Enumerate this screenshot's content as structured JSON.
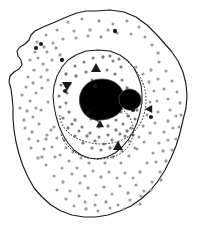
{
  "figure": {
    "name": "cell-diagram",
    "caption": "",
    "background_color": "#ffffff",
    "width": 207,
    "height": 235
  },
  "palette": {
    "outline": "#1a1a1a",
    "envelope": "#1a1a1a",
    "chromatin": "#262626",
    "organelle_fill": "#8a8a8a",
    "organelle_stroke": "#4d4d4d",
    "granule_light": "#9a9a9a",
    "granule_mid": "#7a7a7a",
    "granule_dark": "#1a1a1a",
    "background": "#ffffff"
  },
  "structures": {
    "plasma_membrane": {
      "label": "plasma-membrane",
      "path": "M 96 11 L 110 10 L 124 12 L 136 17 L 147 25 L 157 35 L 165 44 L 172 52 L 178 61 L 183 72 L 186 84 L 187 96 L 186 108 L 183 120 L 180 133 L 176 146 L 171 158 L 165 170 L 158 181 L 150 191 L 141 199 L 131 206 L 120 211 L 108 215 L 96 217 L 84 217 L 72 215 L 61 211 L 51 205 L 42 197 L 34 188 L 28 177 L 23 166 L 19 154 L 16 142 L 14 130 L 13 118 L 13 107 L 12 97 L 11 89 L 9 82 L 10 76 L 14 72 L 19 69 L 22 65 L 21 60 L 18 56 L 17 51 L 20 47 L 25 44 L 29 40 L 31 35 L 35 31 L 41 28 L 48 25 L 55 22 L 62 19 L 69 16 L 77 13 L 86 11 Z"
    },
    "nuclear_envelope": {
      "label": "nuclear-envelope",
      "path": "M 98 50 L 110 51 L 120 55 L 128 61 L 134 68 L 138 76 L 141 85 L 142 94 L 142 103 L 140 113 L 137 123 L 133 132 L 128 140 L 122 147 L 115 153 L 107 157 L 98 159 L 89 158 L 81 155 L 74 150 L 68 143 L 63 135 L 59 126 L 56 116 L 54 106 L 53 96 L 54 86 L 57 76 L 62 67 L 68 60 L 76 55 L 86 51 Z"
    },
    "chromatin_loop": {
      "label": "chromatin-loop",
      "path": "M 128 62 C 137 70, 143 80, 145 90 C 147 101, 146 111, 142 120 C 138 129, 131 136, 122 140 C 112 144, 101 145, 91 143 C 81 141, 72 137, 66 130 C 61 124, 59 118, 60 113"
    },
    "chromatin_loop_lower": {
      "label": "chromatin-loop-lower",
      "path": "M 119 107 C 127 112, 132 119, 133 127 C 134 136, 131 144, 125 150 C 118 156, 109 159, 99 159 C 88 159, 79 156, 72 150 C 66 145, 62 139, 61 133"
    },
    "nucleolus": {
      "label": "nucleolus",
      "cx": 102,
      "cy": 98,
      "rx": 21,
      "ry": 19,
      "fill": "#8a8a8a",
      "path": "M 102 79 C 112 79, 120 84, 123 92 C 126 100, 124 109, 118 114 C 113 118, 106 120, 100 120 C 96 120, 100 122, 101 125 C 100 122, 96 120, 92 119 C 86 117, 82 112, 80 105 C 78 97, 81 88, 88 83 C 92 80, 97 79, 102 79 Z"
    },
    "satellite_body": {
      "label": "satellite-body",
      "cx": 129,
      "cy": 99,
      "rx": 11,
      "ry": 10,
      "fill": "#8a8a8a",
      "path": "M 129 89 C 135 89, 140 93, 141 98 C 142 104, 138 109, 132 110 C 126 111, 120 107, 119 101 C 118 95, 122 90, 129 89 Z"
    }
  },
  "granules": {
    "label": "cytoplasmic-granules",
    "size_small": 1.5,
    "size_large": 2.0,
    "cytoplasm_points": [
      [
        68,
        22
      ],
      [
        82,
        19
      ],
      [
        99,
        21
      ],
      [
        113,
        24
      ],
      [
        127,
        21
      ],
      [
        139,
        27
      ],
      [
        108,
        30
      ],
      [
        90,
        30
      ],
      [
        74,
        31
      ],
      [
        57,
        30
      ],
      [
        46,
        35
      ],
      [
        37,
        42
      ],
      [
        44,
        47
      ],
      [
        53,
        43
      ],
      [
        63,
        39
      ],
      [
        76,
        38
      ],
      [
        88,
        36
      ],
      [
        101,
        37
      ],
      [
        117,
        33
      ],
      [
        131,
        34
      ],
      [
        145,
        37
      ],
      [
        152,
        45
      ],
      [
        158,
        53
      ],
      [
        35,
        52
      ],
      [
        30,
        60
      ],
      [
        38,
        58
      ],
      [
        47,
        52
      ],
      [
        56,
        48
      ],
      [
        43,
        64
      ],
      [
        34,
        70
      ],
      [
        28,
        77
      ],
      [
        26,
        87
      ],
      [
        33,
        83
      ],
      [
        41,
        77
      ],
      [
        47,
        70
      ],
      [
        36,
        93
      ],
      [
        30,
        101
      ],
      [
        27,
        111
      ],
      [
        33,
        117
      ],
      [
        41,
        110
      ],
      [
        48,
        102
      ],
      [
        39,
        124
      ],
      [
        32,
        132
      ],
      [
        38,
        141
      ],
      [
        47,
        135
      ],
      [
        54,
        127
      ],
      [
        44,
        149
      ],
      [
        38,
        158
      ],
      [
        46,
        165
      ],
      [
        55,
        157
      ],
      [
        62,
        168
      ],
      [
        54,
        176
      ],
      [
        63,
        182
      ],
      [
        72,
        174
      ],
      [
        80,
        183
      ],
      [
        70,
        191
      ],
      [
        79,
        196
      ],
      [
        88,
        188
      ],
      [
        96,
        195
      ],
      [
        104,
        187
      ],
      [
        112,
        194
      ],
      [
        120,
        186
      ],
      [
        128,
        193
      ],
      [
        136,
        185
      ],
      [
        144,
        191
      ],
      [
        152,
        182
      ],
      [
        160,
        172
      ],
      [
        166,
        161
      ],
      [
        172,
        150
      ],
      [
        176,
        139
      ],
      [
        179,
        127
      ],
      [
        181,
        115
      ],
      [
        180,
        103
      ],
      [
        177,
        92
      ],
      [
        172,
        81
      ],
      [
        166,
        71
      ],
      [
        159,
        62
      ],
      [
        151,
        70
      ],
      [
        158,
        79
      ],
      [
        164,
        89
      ],
      [
        168,
        99
      ],
      [
        170,
        110
      ],
      [
        168,
        121
      ],
      [
        164,
        132
      ],
      [
        159,
        143
      ],
      [
        153,
        153
      ],
      [
        147,
        163
      ],
      [
        140,
        172
      ],
      [
        133,
        178
      ],
      [
        125,
        173
      ],
      [
        117,
        178
      ],
      [
        109,
        172
      ],
      [
        101,
        177
      ],
      [
        93,
        171
      ],
      [
        85,
        176
      ],
      [
        77,
        168
      ],
      [
        69,
        161
      ],
      [
        73,
        152
      ],
      [
        81,
        158
      ],
      [
        89,
        163
      ],
      [
        97,
        157
      ],
      [
        105,
        163
      ],
      [
        113,
        157
      ],
      [
        121,
        163
      ],
      [
        129,
        156
      ],
      [
        137,
        149
      ],
      [
        144,
        142
      ],
      [
        150,
        133
      ],
      [
        155,
        123
      ],
      [
        158,
        112
      ],
      [
        157,
        101
      ],
      [
        154,
        91
      ],
      [
        149,
        82
      ],
      [
        143,
        74
      ],
      [
        136,
        67
      ],
      [
        150,
        102
      ],
      [
        147,
        115
      ],
      [
        143,
        126
      ],
      [
        139,
        137
      ],
      [
        135,
        148
      ],
      [
        129,
        141
      ],
      [
        122,
        151
      ],
      [
        115,
        145
      ],
      [
        108,
        152
      ],
      [
        101,
        146
      ],
      [
        94,
        152
      ],
      [
        87,
        146
      ],
      [
        80,
        150
      ],
      [
        73,
        143
      ],
      [
        66,
        148
      ],
      [
        60,
        155
      ],
      [
        52,
        147
      ],
      [
        46,
        139
      ],
      [
        51,
        130
      ],
      [
        57,
        138
      ],
      [
        64,
        140
      ],
      [
        22,
        95
      ],
      [
        24,
        120
      ],
      [
        20,
        108
      ],
      [
        29,
        139
      ],
      [
        25,
        128
      ],
      [
        52,
        60
      ],
      [
        60,
        55
      ],
      [
        48,
        80
      ],
      [
        42,
        88
      ],
      [
        36,
        108
      ],
      [
        31,
        148
      ],
      [
        42,
        157
      ],
      [
        57,
        190
      ],
      [
        66,
        199
      ],
      [
        85,
        202
      ],
      [
        95,
        205
      ],
      [
        106,
        202
      ],
      [
        118,
        205
      ],
      [
        130,
        200
      ],
      [
        141,
        196
      ],
      [
        151,
        190
      ],
      [
        161,
        180
      ],
      [
        140,
        204
      ],
      [
        124,
        209
      ],
      [
        110,
        208
      ],
      [
        98,
        211
      ],
      [
        86,
        209
      ],
      [
        74,
        206
      ],
      [
        168,
        140
      ],
      [
        173,
        128
      ],
      [
        176,
        116
      ],
      [
        163,
        151
      ],
      [
        156,
        162
      ]
    ],
    "nucleoplasm_points": [
      [
        84,
        62
      ],
      [
        93,
        58
      ],
      [
        103,
        57
      ],
      [
        113,
        61
      ],
      [
        121,
        67
      ],
      [
        96,
        68
      ],
      [
        86,
        72
      ],
      [
        76,
        76
      ],
      [
        70,
        84
      ],
      [
        67,
        93
      ],
      [
        66,
        103
      ],
      [
        69,
        112
      ],
      [
        75,
        120
      ],
      [
        82,
        127
      ],
      [
        90,
        133
      ],
      [
        99,
        137
      ],
      [
        108,
        135
      ],
      [
        116,
        130
      ],
      [
        123,
        124
      ],
      [
        128,
        116
      ],
      [
        131,
        107
      ],
      [
        130,
        97
      ],
      [
        127,
        88
      ],
      [
        122,
        80
      ],
      [
        115,
        74
      ],
      [
        107,
        70
      ],
      [
        92,
        80
      ],
      [
        86,
        89
      ],
      [
        83,
        99
      ],
      [
        86,
        110
      ],
      [
        91,
        119
      ],
      [
        99,
        127
      ],
      [
        108,
        126
      ],
      [
        116,
        120
      ],
      [
        121,
        112
      ],
      [
        123,
        103
      ],
      [
        75,
        66
      ],
      [
        66,
        74
      ],
      [
        61,
        85
      ],
      [
        59,
        96
      ],
      [
        60,
        107
      ],
      [
        63,
        118
      ],
      [
        68,
        128
      ],
      [
        75,
        136
      ],
      [
        83,
        143
      ],
      [
        92,
        148
      ],
      [
        101,
        150
      ],
      [
        110,
        148
      ],
      [
        118,
        143
      ],
      [
        125,
        136
      ],
      [
        131,
        128
      ],
      [
        135,
        119
      ],
      [
        137,
        110
      ],
      [
        110,
        56
      ],
      [
        119,
        59
      ],
      [
        104,
        144
      ],
      [
        95,
        141
      ],
      [
        87,
        136
      ],
      [
        79,
        131
      ],
      [
        72,
        124
      ],
      [
        112,
        140
      ],
      [
        120,
        134
      ],
      [
        127,
        131
      ],
      [
        133,
        135
      ],
      [
        108,
        118
      ],
      [
        114,
        110
      ]
    ],
    "dark_points": [
      [
        41,
        44
      ],
      [
        36,
        48
      ],
      [
        115,
        31
      ],
      [
        65,
        91
      ],
      [
        133,
        110
      ],
      [
        88,
        113
      ],
      [
        151,
        117
      ],
      [
        62,
        60
      ],
      [
        95,
        86
      ]
    ]
  },
  "markers": {
    "label": "triangular-markers",
    "items": [
      {
        "name": "marker-up-1",
        "x": 96,
        "y": 68,
        "dir": "up",
        "size": 5
      },
      {
        "name": "marker-down-1",
        "x": 67,
        "y": 86,
        "dir": "down",
        "size": 5
      },
      {
        "name": "marker-up-2",
        "x": 100,
        "y": 124,
        "dir": "up",
        "size": 4
      },
      {
        "name": "marker-up-3",
        "x": 118,
        "y": 146,
        "dir": "up",
        "size": 5
      },
      {
        "name": "marker-left-1",
        "x": 149,
        "y": 109,
        "dir": "left",
        "size": 4
      }
    ]
  }
}
